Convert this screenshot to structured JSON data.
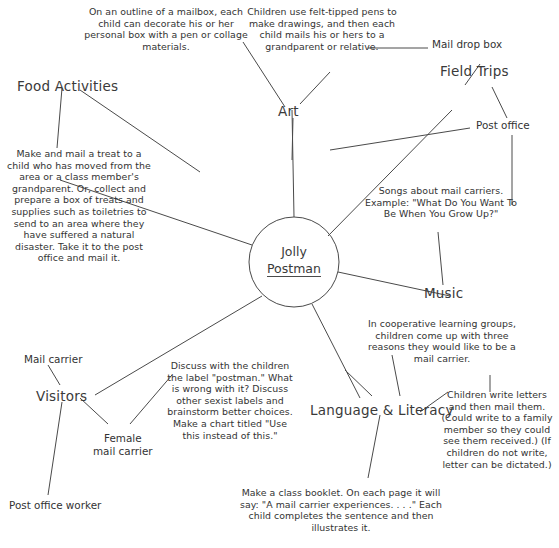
{
  "diagram": {
    "center": {
      "line1": "Jolly",
      "line2": "Postman"
    },
    "branches": {
      "food_activities": "Food Activities",
      "art": "Art",
      "field_trips": "Field Trips",
      "music": "Music",
      "language_literacy": "Language & Literacy",
      "visitors": "Visitors"
    },
    "subnodes": {
      "mail_drop_box": "Mail drop box",
      "post_office": "Post office",
      "mail_carrier": "Mail carrier",
      "female_mail_carrier_l1": "Female",
      "female_mail_carrier_l2": "mail carrier",
      "post_office_worker": "Post office worker"
    },
    "notes": {
      "art_mailbox": "On an outline of a mailbox, each child can decorate his or her personal box with a pen or collage materials.",
      "art_felt_pens": "Children use felt-tipped pens to make drawings, and then each child mails his or hers to a grandparent or relative.",
      "food_treat": "Make and mail a treat to a child who has moved from the area or a class member's grandparent. Or, collect and prepare a box of treats and supplies such as toiletries to send to an area where they have suffered a natural disaster. Take it to the post office and mail it.",
      "music_songs": "Songs about mail carriers. Example: \"What Do You Want To Be When You Grow Up?\"",
      "ll_cooperative": "In cooperative learning groups, children come up with three reasons they would like to be a mail carrier.",
      "ll_discuss": "Discuss with the children the label \"postman.\" What is wrong with it? Discuss other sexist labels and brainstorm better choices. Make a chart titled \"Use this instead of this.\"",
      "ll_booklet": "Make a class booklet. On each page it will say: \"A mail carrier experiences. . . .\" Each child completes the sentence and then illustrates it.",
      "ll_write_letters": "Children write letters and then mail them. (Could write to a family member so they could see them received.) (If children do not write, letter can be dictated.)"
    },
    "colors": {
      "line": "#4a4a4a",
      "text": "#333333",
      "background": "#ffffff"
    }
  }
}
